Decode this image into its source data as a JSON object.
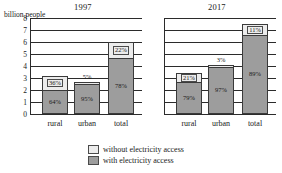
{
  "axis_caption": "billion people",
  "legend": {
    "without": "without electricity access",
    "with": "with electricity access"
  },
  "panels": [
    {
      "title": "1997",
      "categories": [
        "rural",
        "urban",
        "total"
      ],
      "bars": [
        {
          "category": "rural",
          "total": 3.2,
          "with_pct": "64%",
          "without_pct": "36%",
          "without_outside": false
        },
        {
          "category": "urban",
          "total": 2.7,
          "with_pct": "95%",
          "without_pct": "5%",
          "without_outside": true
        },
        {
          "category": "total",
          "total": 6.0,
          "with_pct": "78%",
          "without_pct": "22%",
          "without_outside": false
        }
      ]
    },
    {
      "title": "2017",
      "categories": [
        "rural",
        "urban",
        "total"
      ],
      "bars": [
        {
          "category": "rural",
          "total": 3.45,
          "with_pct": "79%",
          "without_pct": "21%",
          "without_outside": false
        },
        {
          "category": "urban",
          "total": 4.1,
          "with_pct": "97%",
          "without_pct": "3%",
          "without_outside": true
        },
        {
          "category": "total",
          "total": 7.5,
          "with_pct": "89%",
          "without_pct": "11%",
          "without_outside": false
        }
      ]
    }
  ],
  "chart_data": {
    "type": "bar",
    "title": "",
    "subtitle": "",
    "xlabel": "",
    "ylabel": "billion people",
    "ylim": [
      0,
      8
    ],
    "yticks": [
      0,
      1,
      2,
      3,
      4,
      5,
      6,
      7,
      8
    ],
    "grid": true,
    "stacked": true,
    "legend_position": "bottom-center",
    "legend_entries": [
      "without electricity access",
      "with electricity access"
    ],
    "panels": [
      {
        "title": "1997",
        "categories": [
          "rural",
          "urban",
          "total"
        ],
        "series": [
          {
            "name": "with electricity access",
            "values": [
              2.05,
              2.57,
              4.68
            ],
            "percent_labels": [
              "64%",
              "95%",
              "78%"
            ]
          },
          {
            "name": "without electricity access",
            "values": [
              1.15,
              0.13,
              1.32
            ],
            "percent_labels": [
              "36%",
              "5%",
              "22%"
            ]
          }
        ],
        "totals": [
          3.2,
          2.7,
          6.0
        ]
      },
      {
        "title": "2017",
        "categories": [
          "rural",
          "urban",
          "total"
        ],
        "series": [
          {
            "name": "with electricity access",
            "values": [
              2.73,
              3.98,
              6.68
            ],
            "percent_labels": [
              "79%",
              "97%",
              "89%"
            ]
          },
          {
            "name": "without electricity access",
            "values": [
              0.72,
              0.12,
              0.82
            ],
            "percent_labels": [
              "21%",
              "3%",
              "11%"
            ]
          }
        ],
        "totals": [
          3.45,
          4.1,
          7.5
        ]
      }
    ]
  }
}
